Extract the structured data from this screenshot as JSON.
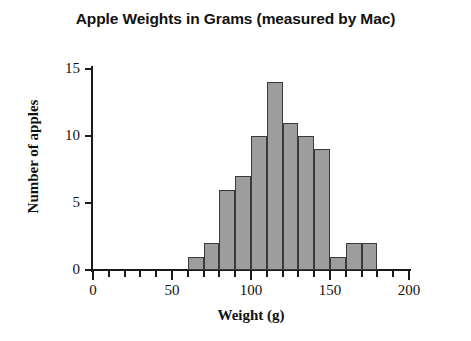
{
  "chart_data": {
    "type": "bar",
    "title": "Apple Weights in Grams (measured by Mac)",
    "xlabel": "Weight (g)",
    "ylabel": "Number of apples",
    "xlim": [
      0,
      200
    ],
    "ylim": [
      0,
      15
    ],
    "grid": false,
    "legend": null,
    "bin_width": 10,
    "x_ticks_major": [
      0,
      50,
      100,
      150,
      200
    ],
    "x_tick_labels": [
      "0",
      "50",
      "100",
      "150",
      "200"
    ],
    "x_ticks_minor": [
      10,
      20,
      30,
      40,
      60,
      70,
      80,
      90,
      110,
      120,
      130,
      140,
      160,
      170,
      180,
      190
    ],
    "y_ticks": [
      0,
      5,
      10,
      15
    ],
    "y_tick_labels": [
      "0",
      "5",
      "10",
      "15"
    ],
    "bar_color": "#9d9d9d",
    "bar_edge_color": "#3a3a3a",
    "bins": [
      {
        "start": 60,
        "end": 70,
        "value": 1
      },
      {
        "start": 70,
        "end": 80,
        "value": 2
      },
      {
        "start": 80,
        "end": 90,
        "value": 6
      },
      {
        "start": 90,
        "end": 100,
        "value": 7
      },
      {
        "start": 100,
        "end": 110,
        "value": 10
      },
      {
        "start": 110,
        "end": 120,
        "value": 14
      },
      {
        "start": 120,
        "end": 130,
        "value": 11
      },
      {
        "start": 130,
        "end": 140,
        "value": 10
      },
      {
        "start": 140,
        "end": 150,
        "value": 9
      },
      {
        "start": 150,
        "end": 160,
        "value": 1
      },
      {
        "start": 160,
        "end": 170,
        "value": 2
      },
      {
        "start": 170,
        "end": 180,
        "value": 2
      }
    ],
    "categories": [
      "60-70",
      "70-80",
      "80-90",
      "90-100",
      "100-110",
      "110-120",
      "120-130",
      "130-140",
      "140-150",
      "150-160",
      "160-170",
      "170-180"
    ],
    "values": [
      1,
      2,
      6,
      7,
      10,
      14,
      11,
      10,
      9,
      1,
      2,
      2
    ]
  }
}
